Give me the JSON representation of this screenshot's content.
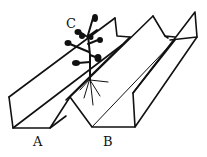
{
  "diagram": {
    "labels": {
      "a": "A",
      "b": "B",
      "c": "C"
    },
    "colors": {
      "line": "#111111",
      "background": "#ffffff"
    }
  }
}
